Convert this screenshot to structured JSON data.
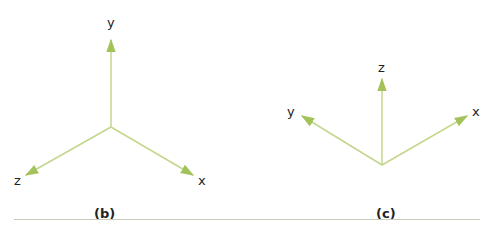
{
  "figure_b": {
    "caption": "(b)",
    "axes": [
      {
        "name": "y",
        "label": "y",
        "direction": "up"
      },
      {
        "name": "z",
        "label": "z",
        "direction": "down-left"
      },
      {
        "name": "x",
        "label": "x",
        "direction": "down-right"
      }
    ]
  },
  "figure_c": {
    "caption": "(c)",
    "axes": [
      {
        "name": "z",
        "label": "z",
        "direction": "up"
      },
      {
        "name": "y",
        "label": "y",
        "direction": "up-left"
      },
      {
        "name": "x",
        "label": "x",
        "direction": "up-right"
      }
    ]
  },
  "colors": {
    "axis": "#b5cc7a",
    "arrowhead": "#a3c25a",
    "divider": "#c8cbb8"
  }
}
